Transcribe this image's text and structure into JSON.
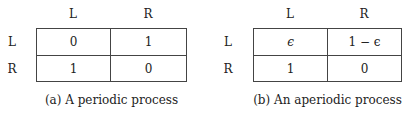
{
  "panels": [
    {
      "id": "a",
      "caption": "(a) A periodic process",
      "column_labels": [
        "L",
        "R"
      ],
      "row_labels": [
        "L",
        "R"
      ],
      "cells": [
        [
          "0",
          "1"
        ],
        [
          "1",
          "0"
        ]
      ]
    },
    {
      "id": "b",
      "caption": "(b) An aperiodic process",
      "column_labels": [
        "L",
        "R"
      ],
      "row_labels": [
        "L",
        "R"
      ],
      "cells": [
        [
          "ϵ",
          "1 − ϵ"
        ],
        [
          "1",
          "0"
        ]
      ]
    }
  ]
}
